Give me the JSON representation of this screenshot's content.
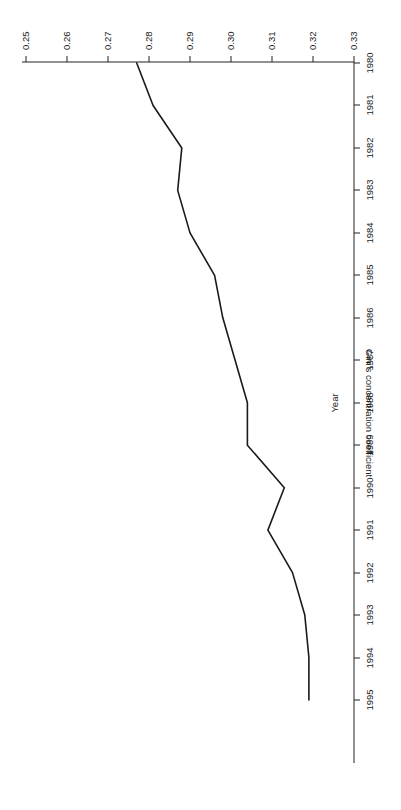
{
  "chart_data": {
    "type": "line",
    "title": "",
    "subtitle": "",
    "xlabel": "Year",
    "ylabel": "Gini's concentration coefficient",
    "x": [
      1980,
      1981,
      1982,
      1983,
      1984,
      1985,
      1986,
      1987,
      1988,
      1989,
      1990,
      1991,
      1992,
      1993,
      1994,
      1995
    ],
    "values": [
      0.277,
      0.281,
      0.288,
      0.287,
      0.29,
      0.296,
      0.298,
      0.301,
      0.304,
      0.304,
      0.313,
      0.309,
      0.315,
      0.318,
      0.319,
      0.319
    ],
    "series": [
      {
        "name": "Gini's concentration coefficient",
        "values": [
          0.277,
          0.281,
          0.288,
          0.287,
          0.29,
          0.296,
          0.298,
          0.301,
          0.304,
          0.304,
          0.313,
          0.309,
          0.315,
          0.318,
          0.319,
          0.319
        ]
      }
    ],
    "xlim": [
      1979.5,
      1995.6
    ],
    "ylim": [
      0.25,
      0.33
    ],
    "xticks": [
      1980,
      1981,
      1982,
      1983,
      1984,
      1985,
      1986,
      1987,
      1988,
      1989,
      1990,
      1991,
      1992,
      1993,
      1994,
      1995
    ],
    "xtick_labels": [
      "1980",
      "1981",
      "1982",
      "1983",
      "1984",
      "1985",
      "1986",
      "1987",
      "1988",
      "1989",
      "1990",
      "1991",
      "1992",
      "1993",
      "1994",
      "1995"
    ],
    "yticks": [
      0.25,
      0.26,
      0.27,
      0.28,
      0.29,
      0.3,
      0.31,
      0.32,
      0.33
    ],
    "ytick_labels": [
      "0.25",
      "0.26",
      "0.27",
      "0.28",
      "0.29",
      "0.30",
      "0.31",
      "0.32",
      "0.33"
    ],
    "grid": false,
    "legend": false,
    "legend_position": "none",
    "line_color": "#1a1a1a",
    "background_color": "#ffffff",
    "rotation_degrees": 180
  },
  "axes": {
    "x_axis_title": "Year",
    "y_axis_title": "Gini's concentration coefficient"
  }
}
